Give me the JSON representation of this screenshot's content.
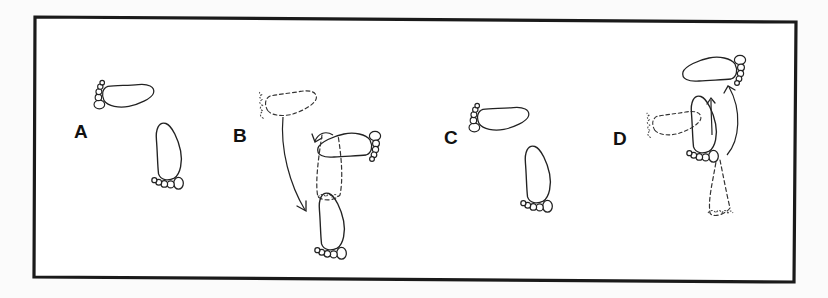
{
  "figure": {
    "panels": [
      {
        "id": "A",
        "label": "A",
        "caption": "Two solid footprints: one pointing left (upper), one pointing down (lower)"
      },
      {
        "id": "B",
        "label": "B",
        "caption": "Dashed prior foot positions with curved arrows showing rotation into final solid footprints"
      },
      {
        "id": "C",
        "label": "C",
        "caption": "Two solid footprints: one pointing left (upper), one pointing down (lower)"
      },
      {
        "id": "D",
        "label": "D",
        "caption": "Dashed prior positions with curved arrows showing pivot to upper-right solid footprint"
      }
    ],
    "colors": {
      "line": "#222222",
      "frame": "#1a1a1a",
      "background": "#ffffff"
    }
  }
}
